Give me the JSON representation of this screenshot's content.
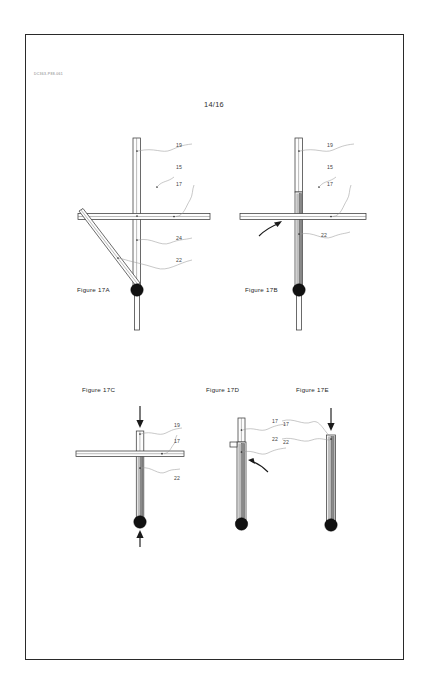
{
  "sheet": {
    "document_code": "DC363-P88.061",
    "sheet_number": "14/16",
    "border_color": "#2a2a2a",
    "background_color": "#ffffff"
  },
  "figures": [
    {
      "id": "17A",
      "caption": "Figure 17A",
      "description": "Collapsible post assembly in fully deployed state with diagonal brace extended",
      "reference_numbers": [
        {
          "label": "19",
          "x": 176,
          "y": 145
        },
        {
          "label": "15",
          "x": 176,
          "y": 168
        },
        {
          "label": "17",
          "x": 176,
          "y": 184
        },
        {
          "label": "24",
          "x": 176,
          "y": 238
        },
        {
          "label": "22",
          "x": 176,
          "y": 260
        }
      ]
    },
    {
      "id": "17B",
      "caption": "Figure 17B",
      "description": "Diagonal brace rotated up against the vertical post, curved arrow indicates rotation",
      "reference_numbers": [
        {
          "label": "19",
          "x": 327,
          "y": 145
        },
        {
          "label": "15",
          "x": 327,
          "y": 168
        },
        {
          "label": "17",
          "x": 327,
          "y": 184
        },
        {
          "label": "22",
          "x": 321,
          "y": 235
        }
      ]
    },
    {
      "id": "17C",
      "caption": "Figure 17C",
      "description": "Assembly being compressed, arrows applied at top of post and at base ball",
      "reference_numbers": [
        {
          "label": "19",
          "x": 172,
          "y": 422
        },
        {
          "label": "17",
          "x": 172,
          "y": 440
        },
        {
          "label": "22",
          "x": 172,
          "y": 477
        }
      ]
    },
    {
      "id": "17D",
      "caption": "Figure 17D",
      "description": "Crossbar folded down along the post, curved arrow indicates folding direction",
      "reference_numbers": [
        {
          "label": "17",
          "x": 281,
          "y": 422
        },
        {
          "label": "22",
          "x": 281,
          "y": 440
        }
      ]
    },
    {
      "id": "17E",
      "caption": "Figure 17E",
      "description": "Fully collapsed assembly, downward arrow at top of post",
      "reference_numbers": [
        {
          "label": "17",
          "x": 271,
          "y": 419
        },
        {
          "label": "22",
          "x": 271,
          "y": 437
        }
      ]
    }
  ],
  "captions": {
    "fig_17a": "Figure 17A",
    "fig_17b": "Figure 17B",
    "fig_17c": "Figure 17C",
    "fig_17d": "Figure 17D",
    "fig_17e": "Figure 17E"
  },
  "labels": {
    "n19": "19",
    "n15": "15",
    "n17": "17",
    "n24": "24",
    "n22": "22"
  }
}
